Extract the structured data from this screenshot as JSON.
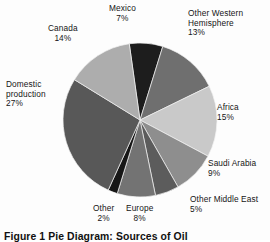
{
  "figure": {
    "caption": "Figure 1  Pie Diagram: Sources of Oil",
    "background_color": "#fdfdfd"
  },
  "chart_data": {
    "type": "pie",
    "title": "",
    "center": {
      "x": 140,
      "y": 120
    },
    "radius": 78,
    "start_angle_deg": -8,
    "direction": "clockwise",
    "legend": "none",
    "grid": false,
    "categories": [
      "Mexico",
      "Other Western Hemisphere",
      "Africa",
      "Saudi Arabia",
      "Other Middle East",
      "Europe",
      "Other",
      "Domestic production",
      "Canada"
    ],
    "values": [
      7,
      13,
      15,
      9,
      5,
      8,
      2,
      27,
      14
    ],
    "unit": "%",
    "total": 100,
    "slices": [
      {
        "label": "Mexico",
        "value": 7,
        "pct_text": "7%",
        "color": "#1d1d1d"
      },
      {
        "label": "Other Western Hemisphere",
        "value": 13,
        "pct_text": "13%",
        "color": "#6f6f6f"
      },
      {
        "label": "Africa",
        "value": 15,
        "pct_text": "15%",
        "color": "#c9c9c9"
      },
      {
        "label": "Saudi Arabia",
        "value": 9,
        "pct_text": "9%",
        "color": "#8e8e8e"
      },
      {
        "label": "Other Middle East",
        "value": 5,
        "pct_text": "5%",
        "color": "#5c5c5c"
      },
      {
        "label": "Europe",
        "value": 8,
        "pct_text": "8%",
        "color": "#737373"
      },
      {
        "label": "Other",
        "value": 2,
        "pct_text": "2%",
        "color": "#161616"
      },
      {
        "label": "Domestic production",
        "value": 27,
        "pct_text": "27%",
        "color": "#585858"
      },
      {
        "label": "Canada",
        "value": 14,
        "pct_text": "14%",
        "color": "#adadad"
      }
    ]
  },
  "labels": {
    "mexico": {
      "name": "Mexico",
      "pct": "7%"
    },
    "owh": {
      "line1": "Other Western",
      "line2": "Hemisphere",
      "pct": "13%"
    },
    "canada": {
      "name": "Canada",
      "pct": "14%"
    },
    "domestic": {
      "line1": "Domestic",
      "line2": "production",
      "pct": "27%"
    },
    "africa": {
      "name": "Africa",
      "pct": "15%"
    },
    "saudi": {
      "name": "Saudi Arabia",
      "pct": "9%"
    },
    "ome": {
      "name": "Other Middle East",
      "pct": "5%"
    },
    "europe": {
      "name": "Europe",
      "pct": "8%"
    },
    "other": {
      "name": "Other",
      "pct": "2%"
    }
  }
}
